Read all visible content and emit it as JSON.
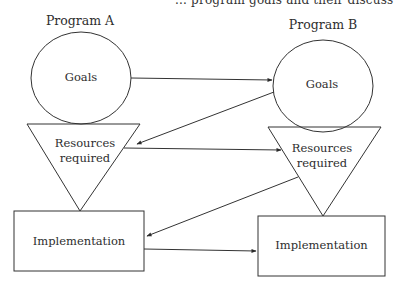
{
  "page": {
    "top_fragment": "... program goals and their discuss"
  },
  "diagram": {
    "program_a": {
      "title": "Program A",
      "goals": "Goals",
      "resources_line1": "Resources",
      "resources_line2": "required",
      "implementation": "Implementation"
    },
    "program_b": {
      "title": "Program B",
      "goals": "Goals",
      "resources_line1": "Resources",
      "resources_line2": "required",
      "implementation": "Implementation"
    },
    "edges": [
      {
        "from": "A.goals",
        "to": "B.goals"
      },
      {
        "from": "B.goals",
        "to": "A.resources"
      },
      {
        "from": "A.resources",
        "to": "B.resources"
      },
      {
        "from": "B.resources",
        "to": "A.implementation"
      },
      {
        "from": "A.implementation",
        "to": "B.implementation"
      }
    ],
    "stroke_color": "#333333"
  }
}
